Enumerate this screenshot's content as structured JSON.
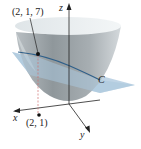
{
  "figure": {
    "type": "3d-surface-diagram",
    "labels": {
      "point_3d": "(2, 1, 7)",
      "point_2d": "(2, 1)",
      "curve": "C",
      "axis_x": "x",
      "axis_y": "y",
      "axis_z": "z"
    },
    "colors": {
      "surface_light": "#e4e8ea",
      "surface_dark": "#9aa2a6",
      "plane": "#a9c6dc",
      "curve": "#2e5f8a",
      "point": "#111111",
      "dashed_line": "#d07070",
      "axis": "#222222"
    }
  }
}
